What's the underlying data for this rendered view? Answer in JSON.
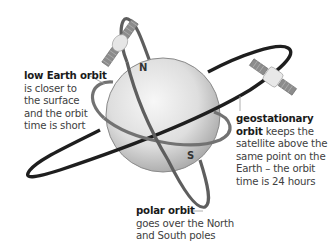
{
  "diagram": {
    "colors": {
      "background": "#ffffff",
      "globe_light": "#f2f2f2",
      "globe_dark": "#b8b8b8",
      "geostationary_orbit": "#222222",
      "low_earth_orbit": "#6e6e6e",
      "polar_orbit": "#5a5a5a",
      "text": "#404040",
      "text_bold": "#1a1a1a"
    },
    "poles": {
      "north": "N",
      "south": "S"
    },
    "labels": {
      "low_earth_orbit": {
        "title": "low Earth orbit",
        "lines": [
          "is closer to",
          "the surface",
          "and the orbit",
          "time is short"
        ]
      },
      "geostationary_orbit": {
        "title_line1": "geostationary",
        "title_line2": "orbit",
        "line2_rest": " keeps the",
        "lines": [
          "satellite above the",
          "same point on the",
          "Earth – the orbit",
          "time is 24 hours"
        ]
      },
      "polar_orbit": {
        "title": "polar orbit",
        "lines": [
          "goes over the North",
          "and South poles"
        ]
      }
    },
    "satellites": [
      {
        "name": "low-earth-orbit-satellite"
      },
      {
        "name": "geostationary-satellite"
      }
    ]
  }
}
